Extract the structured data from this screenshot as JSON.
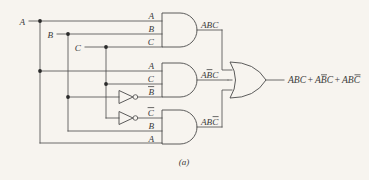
{
  "figure": {
    "label": "(a)",
    "type": "logic-circuit-diagram",
    "background_color": "#f7f4ef",
    "ink_color": "#4a4a4a"
  },
  "inputs": [
    {
      "name": "A",
      "label": "A"
    },
    {
      "name": "B",
      "label": "B"
    },
    {
      "name": "C",
      "label": "C"
    }
  ],
  "gates": {
    "and1": {
      "type": "AND",
      "input_labels": [
        "A",
        "B",
        "C"
      ],
      "output_label": "ABC",
      "output_bar_over": []
    },
    "and2": {
      "type": "AND",
      "input_labels": [
        "A",
        "C",
        "B"
      ],
      "input_bar_over": [
        false,
        false,
        true
      ],
      "output_label": "ABC",
      "output_bar_over": [
        "B"
      ]
    },
    "and3": {
      "type": "AND",
      "input_labels": [
        "C",
        "B",
        "A"
      ],
      "input_bar_over": [
        true,
        false,
        false
      ],
      "output_label": "ABC",
      "output_bar_over": [
        "C"
      ]
    },
    "or1": {
      "type": "OR",
      "output_label": "ABC + ABC + ABC"
    }
  },
  "inverters": [
    {
      "name": "inverter-b",
      "input": "B",
      "output_label": "B",
      "output_barred": true
    },
    {
      "name": "inverter-c",
      "input": "C",
      "output_label": "C",
      "output_barred": true
    }
  ],
  "labels": {
    "in_a_1": "A",
    "in_b_1": "B",
    "in_c_1": "C",
    "in_a_2": "A",
    "in_c_2": "C",
    "in_b_2": "B",
    "in_c_3": "C",
    "in_b_3": "B",
    "in_a_3": "A",
    "out_and1": "ABC",
    "out_and2": "ABC",
    "out_and3": "ABC",
    "bus_a": "A",
    "bus_b": "B",
    "bus_c": "C",
    "final_term1": "ABC",
    "final_plus1": "+",
    "final_term2": "ABC",
    "final_plus2": "+",
    "final_term3": "ABC",
    "figure_caption": "(a)"
  }
}
